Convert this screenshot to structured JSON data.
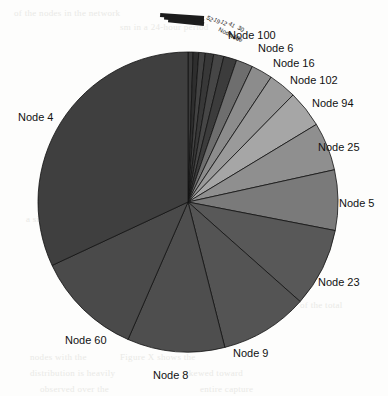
{
  "chart_data": {
    "type": "pie",
    "title": "",
    "legend_position": "outside-labels",
    "grid": false,
    "center": {
      "x": 188,
      "y": 202
    },
    "radius": 150,
    "start_angle_deg": 0,
    "direction": "clockwise",
    "categories": [
      "Node 52",
      "Node 19",
      "Node 12",
      "Node 41",
      "Node 30",
      "Node 100",
      "Node 6",
      "Node 16",
      "Node 102",
      "Node 94",
      "Node 25",
      "Node 5",
      "Node 23",
      "Node 9",
      "Node 8",
      "Node 60",
      "Node 4"
    ],
    "values": [
      0.5,
      0.6,
      0.7,
      0.9,
      1.1,
      1.4,
      1.8,
      2.3,
      3.0,
      4.0,
      5.2,
      6.5,
      8.5,
      9.5,
      10.5,
      11.5,
      32.0
    ],
    "labels_visible": [
      "Node 100",
      "Node 6",
      "Node 16",
      "Node 102",
      "Node 94",
      "Node 25",
      "Node 5",
      "Node 23",
      "Node 9",
      "Node 8",
      "Node 60",
      "Node 4"
    ],
    "labels_crowded": [
      "52",
      "19",
      "12",
      "41",
      "30"
    ],
    "xlabel": "",
    "ylabel": ""
  },
  "chart": {
    "labels": [
      {
        "text": "Node 4",
        "x": 18,
        "y": 112
      },
      {
        "text": "Node 100",
        "x": 228,
        "y": 30
      },
      {
        "text": "Node 6",
        "x": 258,
        "y": 43
      },
      {
        "text": "Node 16",
        "x": 273,
        "y": 58
      },
      {
        "text": "Node 102",
        "x": 290,
        "y": 75
      },
      {
        "text": "Node 94",
        "x": 312,
        "y": 98
      },
      {
        "text": "Node 25",
        "x": 318,
        "y": 142
      },
      {
        "text": "Node 5",
        "x": 339,
        "y": 198
      },
      {
        "text": "Node 23",
        "x": 318,
        "y": 277
      },
      {
        "text": "Node 9",
        "x": 233,
        "y": 348
      },
      {
        "text": "Node 8",
        "x": 153,
        "y": 370
      },
      {
        "text": "Node 60",
        "x": 65,
        "y": 335
      }
    ],
    "crowded_labels": [
      {
        "text": "52",
        "x": 207,
        "y": 14,
        "rot": 32
      },
      {
        "text": "19",
        "x": 214,
        "y": 16,
        "rot": 32
      },
      {
        "text": "12",
        "x": 221,
        "y": 18,
        "rot": 32
      },
      {
        "text": "41",
        "x": 229,
        "y": 20,
        "rot": 32
      },
      {
        "text": "30",
        "x": 238,
        "y": 24,
        "rot": 32
      },
      {
        "text": "Node 10",
        "x": 219,
        "y": 26,
        "rot": 26
      },
      {
        "text": "Node",
        "x": 229,
        "y": 32,
        "rot": 22
      }
    ],
    "slices": [
      {
        "name": "Node 52",
        "start": 0.0,
        "end": 0.55,
        "color": "#3a3a3a"
      },
      {
        "name": "Node 19",
        "start": 0.55,
        "end": 1.15,
        "color": "#2e2e2e"
      },
      {
        "name": "Node 12",
        "start": 1.15,
        "end": 1.85,
        "color": "#424242"
      },
      {
        "name": "Node 41",
        "start": 1.85,
        "end": 2.75,
        "color": "#383838"
      },
      {
        "name": "Node 30",
        "start": 2.75,
        "end": 3.85,
        "color": "#464646"
      },
      {
        "name": "Node 100",
        "start": 3.85,
        "end": 5.25,
        "color": "#3c3c3c"
      },
      {
        "name": "Node 6",
        "start": 5.25,
        "end": 7.05,
        "color": "#6e6e6e"
      },
      {
        "name": "Node 16",
        "start": 7.05,
        "end": 9.35,
        "color": "#8c8c8c"
      },
      {
        "name": "Node 102",
        "start": 9.35,
        "end": 12.35,
        "color": "#9a9a9a"
      },
      {
        "name": "Node 94",
        "start": 12.35,
        "end": 16.35,
        "color": "#a6a6a6"
      },
      {
        "name": "Node 25",
        "start": 16.35,
        "end": 21.55,
        "color": "#8f8f8f"
      },
      {
        "name": "Node 5",
        "start": 21.55,
        "end": 28.05,
        "color": "#7a7a7a"
      },
      {
        "name": "Node 23",
        "start": 28.05,
        "end": 36.55,
        "color": "#585858"
      },
      {
        "name": "Node 9",
        "start": 36.55,
        "end": 46.05,
        "color": "#545454"
      },
      {
        "name": "Node 8",
        "start": 46.05,
        "end": 56.55,
        "color": "#4e4e4e"
      },
      {
        "name": "Node 60",
        "start": 56.55,
        "end": 68.05,
        "color": "#4a4a4a"
      },
      {
        "name": "Node 4",
        "start": 68.05,
        "end": 100.0,
        "color": "#3f3f3f"
      }
    ],
    "slivers": [
      {
        "len": 44,
        "y": 16,
        "rot": 4
      },
      {
        "len": 40,
        "y": 19,
        "rot": 5
      },
      {
        "len": 36,
        "y": 22,
        "rot": 6
      }
    ],
    "background_marks": [
      {
        "text": "of the nodes in the network",
        "x": 14,
        "y": 8,
        "rot": 0
      },
      {
        "text": "sm in a 24-hour period",
        "x": 120,
        "y": 22,
        "rot": 0
      },
      {
        "text": "traffic volume",
        "x": 250,
        "y": 118,
        "rot": 0
      },
      {
        "text": "the top 20 nodes",
        "x": 248,
        "y": 135,
        "rot": 0
      },
      {
        "text": "accounted for",
        "x": 252,
        "y": 152,
        "rot": 0
      },
      {
        "text": "a single source",
        "x": 26,
        "y": 214,
        "rot": 0
      },
      {
        "text": "of the total",
        "x": 300,
        "y": 300,
        "rot": 0
      },
      {
        "text": "in the X graph for",
        "x": 150,
        "y": 332,
        "rot": 0
      },
      {
        "text": "nodes with the",
        "x": 30,
        "y": 352,
        "rot": 0
      },
      {
        "text": "Figure X shows the",
        "x": 120,
        "y": 352,
        "rot": 0
      },
      {
        "text": "distribution is heavily",
        "x": 30,
        "y": 368,
        "rot": 0
      },
      {
        "text": "skewed toward",
        "x": 185,
        "y": 368,
        "rot": 0
      },
      {
        "text": "observed over the",
        "x": 40,
        "y": 384,
        "rot": 0
      },
      {
        "text": "entire capture",
        "x": 200,
        "y": 384,
        "rot": 0
      }
    ]
  }
}
